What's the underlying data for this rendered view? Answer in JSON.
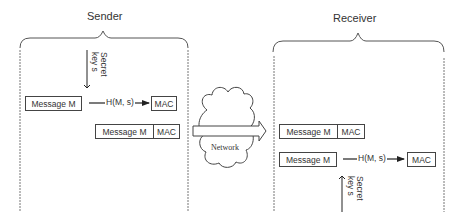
{
  "sender": {
    "title": "Sender",
    "secret_key_line1": "Secret",
    "secret_key_line2": "key s",
    "message_box": "Message M",
    "hash_label": "H(M, s)",
    "mac_box": "MAC",
    "output_message": "Message M",
    "output_mac": "MAC"
  },
  "network": {
    "label": "Network"
  },
  "receiver": {
    "title": "Receiver",
    "received_message": "Message M",
    "received_mac": "MAC",
    "message_box": "Message M",
    "hash_label": "H(M, s)",
    "mac_box": "MAC",
    "secret_key_line1": "Secret",
    "secret_key_line2": "key s"
  },
  "colors": {
    "line": "#444444",
    "background": "#ffffff"
  }
}
